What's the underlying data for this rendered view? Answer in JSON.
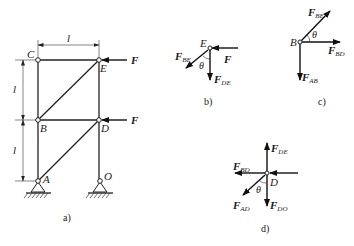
{
  "figure": {
    "a": {
      "caption": "a)",
      "nodes": {
        "C": "C",
        "E": "E",
        "B": "B",
        "D": "D",
        "A": "A",
        "O": "O"
      },
      "dimension_labels": {
        "top": "l",
        "upper": "l",
        "lower": "l"
      },
      "loads": {
        "at_E": "F",
        "at_D": "F"
      }
    },
    "b": {
      "caption": "b)",
      "node": "E",
      "angle": "θ",
      "forces": {
        "applied": {
          "main": "F",
          "sub": ""
        },
        "be": {
          "main": "F",
          "sub": "BE"
        },
        "de": {
          "main": "F",
          "sub": "DE"
        }
      }
    },
    "c": {
      "caption": "c)",
      "node": "B",
      "angle": "θ",
      "forces": {
        "be": {
          "main": "F",
          "sub": "BE"
        },
        "bd": {
          "main": "F",
          "sub": "BD"
        },
        "ab": {
          "main": "F",
          "sub": "AB"
        }
      }
    },
    "d": {
      "caption": "d)",
      "node": "D",
      "angle": "θ",
      "forces": {
        "de": {
          "main": "F",
          "sub": "DE"
        },
        "bd": {
          "main": "F",
          "sub": "BD"
        },
        "ad": {
          "main": "F",
          "sub": "AD"
        },
        "do": {
          "main": "F",
          "sub": "DO"
        }
      }
    }
  }
}
